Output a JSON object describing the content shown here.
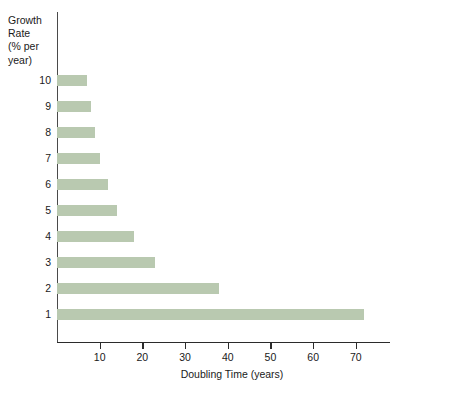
{
  "chart_data": {
    "type": "bar",
    "orientation": "horizontal",
    "title": "",
    "xlabel": "Doubling Time (years)",
    "ylabel": "Growth Rate\n(% per\nyear)",
    "ylabel_lines": [
      "Growth",
      "Rate",
      "(% per",
      "year)"
    ],
    "categories": [
      "10",
      "9",
      "8",
      "7",
      "6",
      "5",
      "4",
      "3",
      "2",
      "1"
    ],
    "values": [
      7,
      8,
      9,
      10,
      12,
      14,
      18,
      23,
      38,
      72
    ],
    "xlim": [
      0,
      78
    ],
    "xticks": [
      10,
      20,
      30,
      40,
      50,
      60,
      70
    ],
    "xtick_labels": [
      "10",
      "20",
      "30",
      "40",
      "50",
      "60",
      "70"
    ],
    "grid": false,
    "legend": false,
    "bar_color": "#b9c9b0",
    "axis_color": "#2b2b2b",
    "background": "#ffffff"
  }
}
